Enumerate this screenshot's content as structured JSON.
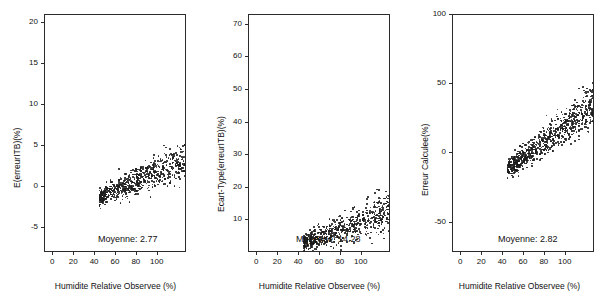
{
  "figure": {
    "background": "#ffffff",
    "point_color": "#1c1c1c",
    "axis_color": "#2b2b2b"
  },
  "chart_data": [
    {
      "type": "scatter",
      "panel_label": "a)",
      "title": "",
      "xlabel": "Humidite Relative Observee (%)",
      "ylabel": "E(erreurITB)(%)",
      "xlim": [
        -8,
        128
      ],
      "ylim": [
        -8,
        21
      ],
      "xticks": [
        0,
        20,
        40,
        60,
        80,
        100
      ],
      "yticks": [
        -5,
        0,
        5,
        10,
        15,
        20
      ],
      "grid": false,
      "legend": "none",
      "annotation": "Moyenne: 2.77",
      "n_points": 900,
      "cloud": {
        "x_range": [
          2,
          120
        ],
        "y_at_x0": 0.4,
        "slope": 0.055,
        "y_spread": 2.0
      }
    },
    {
      "type": "scatter",
      "panel_label": "b)",
      "title": "",
      "xlabel": "Humidite Relative Observee (%)",
      "ylabel": "Ecart-Type(erreurITB)(%)",
      "xlim": [
        -8,
        128
      ],
      "ylim": [
        0,
        73
      ],
      "xticks": [
        0,
        20,
        40,
        60,
        80,
        100
      ],
      "yticks": [
        10,
        20,
        30,
        40,
        50,
        60,
        70
      ],
      "grid": false,
      "legend": "none",
      "annotation": "Moyenne: 14.28",
      "n_points": 900,
      "cloud": {
        "x_range": [
          2,
          120
        ],
        "y_at_x0": 7.0,
        "slope": 0.12,
        "y_spread": 5.0
      }
    },
    {
      "type": "scatter",
      "panel_label": "c)",
      "title": "",
      "xlabel": "Humidite Relative Observee (%)",
      "ylabel": "Erreur Calculee(%)",
      "xlim": [
        -8,
        128
      ],
      "ylim": [
        -72,
        100
      ],
      "xticks": [
        0,
        20,
        40,
        60,
        80,
        100
      ],
      "yticks": [
        -50,
        0,
        50,
        100
      ],
      "grid": false,
      "legend": "none",
      "annotation": "Moyenne: 2.82",
      "n_points": 1100,
      "cloud": {
        "x_range": [
          2,
          124
        ],
        "y_at_x0": -2.0,
        "slope": 0.55,
        "y_spread": 13.0
      }
    }
  ]
}
